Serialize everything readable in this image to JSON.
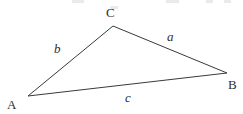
{
  "figure": {
    "kind": "geometry-diagram",
    "shape": "triangle",
    "background_color": "#ffffff",
    "stroke_color": "#3a3a3a",
    "text_color": "#2e2e2e",
    "stroke_width": 1,
    "width": 243,
    "height": 114,
    "vertices": [
      {
        "id": "A",
        "label": "A",
        "x": 28,
        "y": 96
      },
      {
        "id": "B",
        "label": "B",
        "x": 227,
        "y": 73
      },
      {
        "id": "C",
        "label": "C",
        "x": 113,
        "y": 26
      }
    ],
    "sides": [
      {
        "id": "a",
        "label": "a",
        "from": "C",
        "to": "B",
        "label_x": 170,
        "label_y": 36
      },
      {
        "id": "b",
        "label": "b",
        "from": "A",
        "to": "C",
        "label_x": 58,
        "label_y": 48
      },
      {
        "id": "c",
        "label": "c",
        "from": "A",
        "to": "B",
        "label_x": 128,
        "label_y": 97
      }
    ],
    "path": "M 28 96 L 113 26 L 227 73 Z"
  }
}
